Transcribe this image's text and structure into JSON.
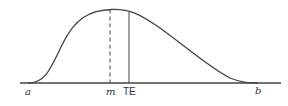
{
  "diagram": {
    "type": "skewed distribution curve (beta/PERT)",
    "labels": {
      "a": "a",
      "m": "m",
      "te": "TE",
      "b": "b"
    },
    "colors": {
      "line": "#444444",
      "background": "#ffffff"
    }
  }
}
